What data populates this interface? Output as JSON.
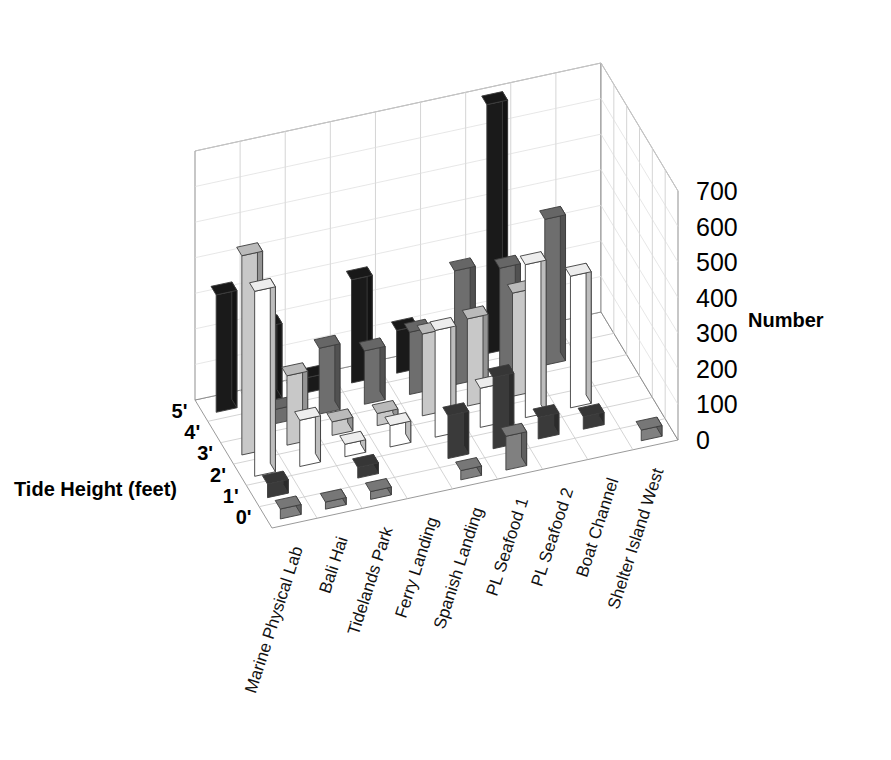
{
  "chart_data": {
    "type": "bar",
    "subtype": "3d-grouped-bar",
    "title": "",
    "xlabel": "",
    "ylabel": "Tide Height (feet)",
    "zlabel": "Number",
    "zlim": [
      0,
      700
    ],
    "ztick_step": 100,
    "zticks": [
      "700",
      "600",
      "500",
      "400",
      "300",
      "200",
      "100",
      "0"
    ],
    "grid": true,
    "legend": "none",
    "categories": [
      "Marine Physical Lab",
      "Bali Hai",
      "Tidelands Park",
      "Ferry Landing",
      "Spanish Landing",
      "PL Seafood 1",
      "PL Seafood 2",
      "Boat Channel",
      "Shelter Island West"
    ],
    "depth_categories": [
      "0'",
      "1'",
      "2'",
      "3'",
      "4'",
      "5'"
    ],
    "series": [
      {
        "name": "0'",
        "color": "#808080",
        "values": [
          28,
          20,
          22,
          0,
          26,
          95,
          0,
          0,
          30
        ]
      },
      {
        "name": "1'",
        "color": "#3a3a3a",
        "values": [
          38,
          0,
          30,
          0,
          120,
          200,
          60,
          35,
          0
        ]
      },
      {
        "name": "2'",
        "color": "#ffffff",
        "values": [
          520,
          130,
          35,
          60,
          300,
          110,
          430,
          370,
          0
        ]
      },
      {
        "name": "3'",
        "color": "#c8c8c8",
        "values": [
          560,
          195,
          38,
          34,
          230,
          245,
          290,
          0,
          0
        ]
      },
      {
        "name": "4'",
        "color": "#6e6e6e",
        "values": [
          0,
          40,
          185,
          150,
          175,
          320,
          300,
          410,
          0
        ]
      },
      {
        "name": "5'",
        "color": "#1a1a1a",
        "values": [
          330,
          210,
          42,
          290,
          120,
          75,
          700,
          40,
          0
        ]
      }
    ]
  },
  "axes": {
    "z_label": "Number",
    "y_label": "Tide Height (feet)"
  }
}
